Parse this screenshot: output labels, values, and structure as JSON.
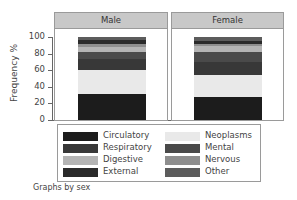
{
  "chart_data": {
    "type": "bar",
    "stacked": true,
    "percent": true,
    "title": "",
    "xlabel": "",
    "ylabel": "Frequency %",
    "ylim": [
      0,
      100
    ],
    "yticks": [
      0,
      20,
      40,
      60,
      80,
      100
    ],
    "panels": [
      "Male",
      "Female"
    ],
    "panel_by": "sex",
    "series": [
      {
        "name": "Circulatory",
        "color": "#1c1c1c",
        "values": [
          31,
          28
        ]
      },
      {
        "name": "Neoplasms",
        "color": "#e9e9e9",
        "values": [
          29,
          26
        ]
      },
      {
        "name": "Respiratory",
        "color": "#383838",
        "values": [
          13,
          16
        ]
      },
      {
        "name": "Mental",
        "color": "#4a4a4a",
        "values": [
          9,
          12
        ]
      },
      {
        "name": "Digestive",
        "color": "#b4b4b4",
        "values": [
          6,
          7
        ]
      },
      {
        "name": "Nervous",
        "color": "#8e8e8e",
        "values": [
          4,
          3
        ]
      },
      {
        "name": "External",
        "color": "#2a2a2a",
        "values": [
          4,
          3
        ]
      },
      {
        "name": "Other",
        "color": "#5c5c5c",
        "values": [
          4,
          5
        ]
      }
    ],
    "legend": {
      "position": "bottom",
      "columns": 2,
      "items": [
        "Circulatory",
        "Neoplasms",
        "Respiratory",
        "Mental",
        "Digestive",
        "Nervous",
        "External",
        "Other"
      ]
    },
    "note": "Graphs by sex",
    "grid": false
  },
  "axis": {
    "ylabel": "Frequency %",
    "ticks": [
      "100",
      "80",
      "60",
      "40",
      "20",
      "0"
    ]
  },
  "panels": [
    {
      "label": "Male"
    },
    {
      "label": "Female"
    }
  ],
  "legend": {
    "col1": [
      {
        "label": "Circulatory",
        "color": "#1c1c1c"
      },
      {
        "label": "Respiratory",
        "color": "#383838"
      },
      {
        "label": "Digestive",
        "color": "#b4b4b4"
      },
      {
        "label": "External",
        "color": "#2a2a2a"
      }
    ],
    "col2": [
      {
        "label": "Neoplasms",
        "color": "#e9e9e9"
      },
      {
        "label": "Mental",
        "color": "#4a4a4a"
      },
      {
        "label": "Nervous",
        "color": "#8e8e8e"
      },
      {
        "label": "Other",
        "color": "#5c5c5c"
      }
    ]
  },
  "note": "Graphs by sex"
}
